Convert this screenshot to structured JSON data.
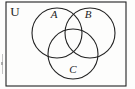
{
  "figure": {
    "type": "venn-diagram",
    "set_count": 3,
    "stroke_color": "#222222",
    "fill_color": "none",
    "background_color": "#fdfdfc"
  },
  "universe": {
    "label": "U",
    "shape": "rectangle",
    "label_style": "upright-serif",
    "x": 6,
    "y": 2,
    "width": 120,
    "height": 84
  },
  "sets": [
    {
      "label": "A",
      "shape": "circle",
      "cx": 57,
      "cy": 33,
      "r": 25,
      "label_x": 54,
      "label_y": 14,
      "label_style": "italic-serif"
    },
    {
      "label": "B",
      "shape": "circle",
      "cx": 90,
      "cy": 33,
      "r": 25,
      "label_x": 88,
      "label_y": 14,
      "label_style": "italic-serif"
    },
    {
      "label": "C",
      "shape": "circle",
      "cx": 73,
      "cy": 54,
      "r": 25,
      "label_x": 73,
      "label_y": 69,
      "label_style": "italic-serif"
    }
  ]
}
